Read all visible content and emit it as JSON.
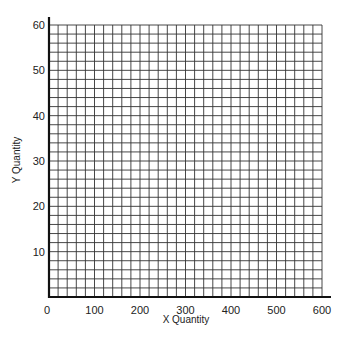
{
  "chart_data": {
    "type": "scatter",
    "title": "",
    "xlabel": "X Quantity",
    "ylabel": "Y Quantity",
    "xlim": [
      0,
      600
    ],
    "ylim": [
      0,
      60
    ],
    "x_ticks": [
      0,
      100,
      200,
      300,
      400,
      500,
      600
    ],
    "y_ticks": [
      10,
      20,
      30,
      40,
      50,
      60
    ],
    "x_tick_labels": [
      "0",
      "100",
      "200",
      "300",
      "400",
      "500",
      "600"
    ],
    "y_tick_labels": [
      "10",
      "20",
      "30",
      "40",
      "50",
      "60"
    ],
    "grid": true,
    "grid_minor_x_step": 20,
    "grid_minor_y_step": 2,
    "series": [],
    "legend": null
  },
  "colors": {
    "grid": "#333333",
    "axis": "#111111",
    "background": "#ffffff"
  }
}
